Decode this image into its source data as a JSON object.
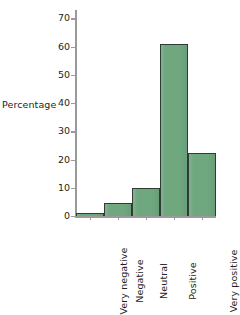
{
  "chart_data": {
    "type": "bar",
    "title": "",
    "xlabel": "",
    "ylabel": "Percentage",
    "categories": [
      "Very negative",
      "Negative",
      "Neutral",
      "Positive",
      "Very positive"
    ],
    "values": [
      1,
      4.5,
      10,
      61,
      22.5
    ],
    "ylim": [
      0,
      73
    ],
    "yticks": [
      0,
      10,
      20,
      30,
      40,
      50,
      60,
      70
    ],
    "ytick_labels": [
      "0",
      "10",
      "20",
      "30",
      "40",
      "50",
      "60",
      "70"
    ],
    "grid": false,
    "legend": null,
    "bar_fill_color": "#6fa77f",
    "bar_edge_color": "#2f3b33",
    "axis_color": "#9a9a9a",
    "background_color": "#ffffff",
    "x_tick_label_rotation": 90,
    "bars_adjacent": true
  },
  "title_sliver": {
    "text": ""
  }
}
